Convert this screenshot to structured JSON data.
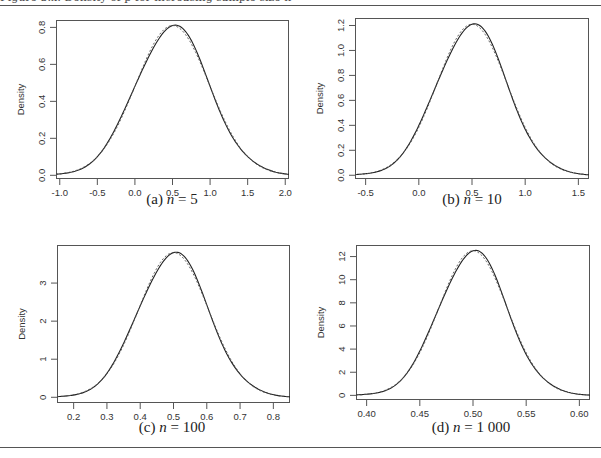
{
  "figure": {
    "top_caption": "Figure 3.x: Density of p̂ for increasing sample size n",
    "panels": [
      {
        "caption": "(a) n = 5",
        "label": "(a)",
        "n": "5"
      },
      {
        "caption": "(b) n = 10",
        "label": "(b)",
        "n": "10"
      },
      {
        "caption": "(c) n = 100",
        "label": "(c)",
        "n": "100"
      },
      {
        "caption": "(d) n = 1 000",
        "label": "(d)",
        "n": "1 000"
      }
    ]
  },
  "chart_data": [
    {
      "type": "line",
      "title": "(a) n = 5",
      "xlabel": "",
      "ylabel": "Density",
      "xlim": [
        -1.05,
        2.05
      ],
      "ylim": [
        -0.02,
        0.84
      ],
      "xticks": [
        -1.0,
        -0.5,
        0.0,
        0.5,
        1.0,
        1.5,
        2.0
      ],
      "xtick_labels": [
        "-1.0",
        "-0.5",
        "0.0",
        "0.5",
        "1.0",
        "1.5",
        "2.0"
      ],
      "yticks": [
        0.0,
        0.2,
        0.4,
        0.6,
        0.8
      ],
      "ytick_labels": [
        "0.0",
        "0.2",
        "0.4",
        "0.6",
        "0.8"
      ],
      "grid": false,
      "series": [
        {
          "name": "empirical density",
          "style": "solid",
          "mean": 0.5,
          "sd": 0.49,
          "peak": 0.81
        },
        {
          "name": "normal approximation",
          "style": "dashed",
          "mean": 0.5,
          "sd": 0.49,
          "peak": 0.81
        }
      ]
    },
    {
      "type": "line",
      "title": "(b) n = 10",
      "xlabel": "",
      "ylabel": "Density",
      "xlim": [
        -0.6,
        1.6
      ],
      "ylim": [
        -0.03,
        1.26
      ],
      "xticks": [
        -0.5,
        0.0,
        0.5,
        1.0,
        1.5
      ],
      "xtick_labels": [
        "-0.5",
        "0.0",
        "0.5",
        "1.0",
        "1.5"
      ],
      "yticks": [
        0.0,
        0.2,
        0.4,
        0.6,
        0.8,
        1.0,
        1.2
      ],
      "ytick_labels": [
        "0.0",
        "0.2",
        "0.4",
        "0.6",
        "0.8",
        "1.0",
        "1.2"
      ],
      "grid": false,
      "series": [
        {
          "name": "empirical density",
          "style": "solid",
          "mean": 0.5,
          "sd": 0.33,
          "peak": 1.21
        },
        {
          "name": "normal approximation",
          "style": "dashed",
          "mean": 0.5,
          "sd": 0.33,
          "peak": 1.21
        }
      ]
    },
    {
      "type": "line",
      "title": "(c) n = 100",
      "xlabel": "",
      "ylabel": "Density",
      "xlim": [
        0.15,
        0.85
      ],
      "ylim": [
        -0.15,
        4.0
      ],
      "xticks": [
        0.2,
        0.3,
        0.4,
        0.5,
        0.6,
        0.7,
        0.8
      ],
      "xtick_labels": [
        "0.2",
        "0.3",
        "0.4",
        "0.5",
        "0.6",
        "0.7",
        "0.8"
      ],
      "yticks": [
        0,
        1,
        2,
        3
      ],
      "ytick_labels": [
        "0",
        "1",
        "2",
        "3"
      ],
      "grid": false,
      "series": [
        {
          "name": "empirical density",
          "style": "solid",
          "mean": 0.5,
          "sd": 0.105,
          "peak": 3.8
        },
        {
          "name": "normal approximation",
          "style": "dashed",
          "mean": 0.5,
          "sd": 0.105,
          "peak": 3.8
        }
      ]
    },
    {
      "type": "line",
      "title": "(d) n = 1 000",
      "xlabel": "",
      "ylabel": "Density",
      "xlim": [
        0.39,
        0.61
      ],
      "ylim": [
        -0.4,
        13.0
      ],
      "xticks": [
        0.4,
        0.45,
        0.5,
        0.55,
        0.6
      ],
      "xtick_labels": [
        "0.40",
        "0.45",
        "0.50",
        "0.55",
        "0.60"
      ],
      "yticks": [
        0,
        2,
        4,
        6,
        8,
        10,
        12
      ],
      "ytick_labels": [
        "0",
        "2",
        "4",
        "6",
        "8",
        "10",
        "12"
      ],
      "grid": false,
      "series": [
        {
          "name": "empirical density",
          "style": "solid",
          "mean": 0.5,
          "sd": 0.032,
          "peak": 12.5
        },
        {
          "name": "normal approximation",
          "style": "dashed",
          "mean": 0.5,
          "sd": 0.032,
          "peak": 12.5
        }
      ]
    }
  ],
  "layout": {
    "panels_px": [
      {
        "left": 56,
        "top": 20,
        "right": 289,
        "bottom": 179,
        "cap_x": 172,
        "cap_y": 200
      },
      {
        "left": 355,
        "top": 18,
        "right": 589,
        "bottom": 179,
        "cap_x": 472,
        "cap_y": 200
      },
      {
        "left": 57,
        "top": 245,
        "right": 290,
        "bottom": 403,
        "cap_x": 172,
        "cap_y": 428
      },
      {
        "left": 356,
        "top": 245,
        "right": 590,
        "bottom": 400,
        "cap_x": 471,
        "cap_y": 428
      }
    ],
    "rules_y": [
      5,
      447
    ]
  }
}
